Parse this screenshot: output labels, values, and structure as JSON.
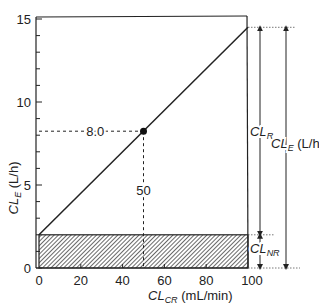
{
  "chart_data": {
    "type": "line",
    "title": "",
    "xlabel": {
      "main": "CL",
      "sub": "CR",
      "unit": " (mL/min)"
    },
    "ylabel": {
      "main": "CL",
      "sub": "E",
      "unit": " (L/h)"
    },
    "xlim": [
      0,
      100
    ],
    "ylim": [
      0,
      15
    ],
    "xticks": [
      0,
      20,
      40,
      60,
      80,
      100
    ],
    "xtick_labels": [
      "0",
      "20",
      "40",
      "60",
      "80",
      "100"
    ],
    "yticks": [
      0,
      5,
      10,
      15
    ],
    "ytick_labels": [
      "0",
      "5",
      "10",
      "15"
    ],
    "y_minor_step": 1,
    "grid": false,
    "series": [
      {
        "name": "CL_E line",
        "x": [
          0,
          100
        ],
        "y": [
          2,
          14.5
        ]
      }
    ],
    "highlight_point": {
      "x": 50,
      "y": 8.0
    },
    "hatched_region": {
      "name": "CL_NR",
      "y_from": 0,
      "y_to": 2,
      "x_from": 0,
      "x_to": 100
    },
    "annotations": {
      "point_y_label": "8.0",
      "point_x_label": "50",
      "cl_r": {
        "main": "CL",
        "sub": "R",
        "unit": ""
      },
      "cl_e": {
        "main": "CL",
        "sub": "E",
        "unit": " (L/h)"
      },
      "cl_nr": {
        "main": "CL",
        "sub": "NR",
        "unit": ""
      }
    }
  }
}
